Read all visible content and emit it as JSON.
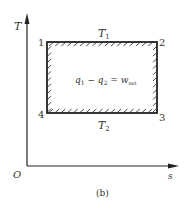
{
  "diagram": {
    "type": "T-s diagram (Carnot cycle)",
    "caption": "(b)",
    "axes": {
      "y_label": "T",
      "x_label": "s",
      "origin_label": "O"
    },
    "states": [
      {
        "id": "1",
        "label": "1"
      },
      {
        "id": "2",
        "label": "2"
      },
      {
        "id": "3",
        "label": "3"
      },
      {
        "id": "4",
        "label": "4"
      }
    ],
    "isotherms": {
      "upper": {
        "base": "T",
        "sub": "1"
      },
      "lower": {
        "base": "T",
        "sub": "2"
      }
    },
    "equation": {
      "q1_base": "q",
      "q1_sub": "1",
      "minus": " − ",
      "q2_base": "q",
      "q2_sub": "2",
      "equals": " = ",
      "w_base": "w",
      "w_sub": "net"
    },
    "colors": {
      "line": "#222222",
      "text": "#333333"
    }
  }
}
